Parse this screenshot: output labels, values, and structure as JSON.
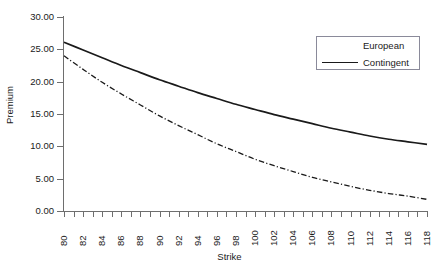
{
  "chart_data": {
    "type": "line",
    "title": "",
    "xlabel": "Strike",
    "ylabel": "Premium",
    "xlim": [
      80,
      118
    ],
    "ylim": [
      0,
      30
    ],
    "grid": false,
    "legend_position": "top-right",
    "x_tick_labels": [
      "80",
      "82",
      "84",
      "86",
      "88",
      "90",
      "92",
      "94",
      "96",
      "98",
      "100",
      "102",
      "104",
      "106",
      "108",
      "110",
      "112",
      "114",
      "116",
      "118"
    ],
    "x_minor_tick_count": 39,
    "y_tick_labels": [
      "30.00",
      "25.00",
      "20.00",
      "15.00",
      "10.00",
      "5.00",
      "0.00"
    ],
    "y_tick_values": [
      30,
      25,
      20,
      15,
      10,
      5,
      0
    ],
    "x": [
      80,
      82,
      84,
      86,
      88,
      90,
      92,
      94,
      96,
      98,
      100,
      102,
      104,
      106,
      108,
      110,
      112,
      114,
      116,
      118
    ],
    "series": [
      {
        "name": "European",
        "style": "dash-dot",
        "color": "#1a1a1a",
        "values": [
          24.0,
          21.9,
          19.9,
          18.1,
          16.4,
          14.7,
          13.2,
          11.8,
          10.4,
          9.2,
          8.0,
          7.0,
          6.1,
          5.2,
          4.5,
          3.8,
          3.2,
          2.7,
          2.3,
          1.8
        ]
      },
      {
        "name": "Contingent",
        "style": "solid",
        "color": "#1a1a1a",
        "values": [
          26.1,
          24.9,
          23.7,
          22.5,
          21.4,
          20.3,
          19.3,
          18.3,
          17.4,
          16.5,
          15.7,
          14.9,
          14.2,
          13.5,
          12.8,
          12.2,
          11.6,
          11.1,
          10.7,
          10.3
        ]
      }
    ]
  },
  "axis": {
    "y_title": "Premium",
    "x_title": "Strike"
  },
  "legend": {
    "entries": [
      {
        "label": "European",
        "style": "dash-dot"
      },
      {
        "label": "Contingent",
        "style": "solid"
      }
    ]
  }
}
